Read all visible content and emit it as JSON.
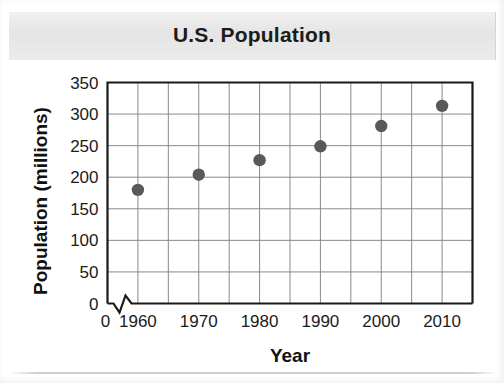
{
  "chart_data": {
    "type": "scatter",
    "title": "U.S. Population",
    "xlabel": "Year",
    "ylabel": "Population (millions)",
    "x": [
      1960,
      1970,
      1980,
      1990,
      2000,
      2010
    ],
    "values": [
      180,
      204,
      227,
      249,
      281,
      313
    ],
    "points": [
      {
        "x": 1960,
        "y": 180
      },
      {
        "x": 1970,
        "y": 204
      },
      {
        "x": 1980,
        "y": 227
      },
      {
        "x": 1990,
        "y": 249
      },
      {
        "x": 2000,
        "y": 281
      },
      {
        "x": 2010,
        "y": 313
      }
    ],
    "xlim": [
      1955,
      2015
    ],
    "ylim": [
      0,
      350
    ],
    "x_major_ticks": [
      1960,
      1970,
      1980,
      1990,
      2000,
      2010
    ],
    "x_tick_labels": [
      "1960",
      "1970",
      "1980",
      "1990",
      "2000",
      "2010"
    ],
    "x_gridline_interval": 5,
    "y_ticks": [
      0,
      50,
      100,
      150,
      200,
      250,
      300,
      350
    ],
    "y_tick_labels": [
      "0",
      "50",
      "100",
      "150",
      "200",
      "250",
      "300",
      "350"
    ],
    "origin_label": "0",
    "axis_break": true,
    "grid": true,
    "legend": "none",
    "marker_color": "#595959",
    "gridline_color": "#8a8a8a",
    "frame_color": "#1a1a1a",
    "title_band_color": "#e4e4e4",
    "background_color": "#ffffff"
  },
  "figure": {
    "title": "U.S. Population",
    "x_axis_title": "Year",
    "y_axis_title": "Population (millions)"
  }
}
